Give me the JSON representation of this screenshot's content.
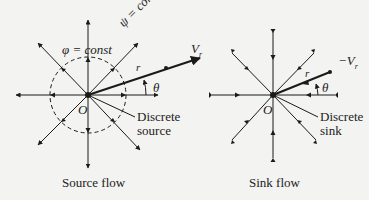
{
  "source_diagram": {
    "origin_label": "O",
    "phi_label": "φ = const",
    "psi_label": "ψ = const",
    "velocity_label": "V",
    "velocity_sub": "r",
    "radius_label": "r",
    "angle_label": "θ",
    "discrete_label_1": "Discrete",
    "discrete_label_2": "source",
    "caption": "Source flow"
  },
  "sink_diagram": {
    "origin_label": "O",
    "velocity_label": "−V",
    "velocity_sub": "r",
    "radius_label": "r",
    "angle_label": "θ",
    "discrete_label_1": "Discrete",
    "discrete_label_2": "sink",
    "caption": "Sink flow"
  },
  "colors": {
    "ink": "#1a1a1a",
    "background": "#f3f3f1"
  }
}
